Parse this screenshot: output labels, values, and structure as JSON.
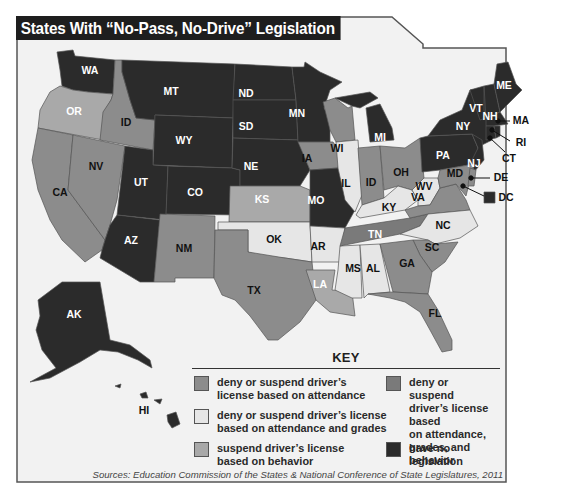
{
  "title": "States With “No-Pass, No-Drive” Legislation",
  "colors": {
    "attendance": "#8c8c8c",
    "attendance_grades": "#e6e6e6",
    "behavior": "#a9a9a9",
    "attendance_grades_behavior": "#7a7a7a",
    "none": "#2b2b2b",
    "background": "#f2f2f2",
    "border": "#555555"
  },
  "key": {
    "title": "KEY",
    "items": [
      {
        "id": "attendance",
        "label": "deny or suspend driver’s\nlicense based on attendance"
      },
      {
        "id": "attendance_grades",
        "label": "deny or suspend driver’s license\nbased on attendance and grades"
      },
      {
        "id": "behavior",
        "label": "suspend driver’s license\nbased on behavior"
      },
      {
        "id": "attendance_grades_behavior",
        "label": "deny or suspend\ndriver’s license based\non attendance,\ngrades, and behavior"
      },
      {
        "id": "none",
        "label": "have no legislation"
      }
    ]
  },
  "states": [
    {
      "label": "WA",
      "category": "none"
    },
    {
      "label": "OR",
      "category": "behavior"
    },
    {
      "label": "CA",
      "category": "attendance"
    },
    {
      "label": "NV",
      "category": "attendance"
    },
    {
      "label": "ID",
      "category": "attendance"
    },
    {
      "label": "MT",
      "category": "none"
    },
    {
      "label": "WY",
      "category": "none"
    },
    {
      "label": "UT",
      "category": "none"
    },
    {
      "label": "AZ",
      "category": "none"
    },
    {
      "label": "CO",
      "category": "none"
    },
    {
      "label": "NM",
      "category": "attendance"
    },
    {
      "label": "ND",
      "category": "none"
    },
    {
      "label": "SD",
      "category": "none"
    },
    {
      "label": "NE",
      "category": "none"
    },
    {
      "label": "KS",
      "category": "behavior"
    },
    {
      "label": "OK",
      "category": "attendance_grades"
    },
    {
      "label": "TX",
      "category": "attendance"
    },
    {
      "label": "MN",
      "category": "none"
    },
    {
      "label": "IA",
      "category": "attendance"
    },
    {
      "label": "MO",
      "category": "none"
    },
    {
      "label": "AR",
      "category": "attendance_grades"
    },
    {
      "label": "LA",
      "category": "behavior"
    },
    {
      "label": "WI",
      "category": "attendance"
    },
    {
      "label": "IL",
      "category": "attendance_grades"
    },
    {
      "label": "MI",
      "category": "none"
    },
    {
      "label": "ID",
      "category": "attendance",
      "note": "Indiana (labeled ID on map)"
    },
    {
      "label": "OH",
      "category": "attendance"
    },
    {
      "label": "KY",
      "category": "attendance_grades"
    },
    {
      "label": "TN",
      "category": "attendance_grades_behavior"
    },
    {
      "label": "MS",
      "category": "attendance_grades"
    },
    {
      "label": "AL",
      "category": "attendance_grades"
    },
    {
      "label": "GA",
      "category": "attendance"
    },
    {
      "label": "FL",
      "category": "attendance"
    },
    {
      "label": "SC",
      "category": "attendance"
    },
    {
      "label": "NC",
      "category": "attendance_grades"
    },
    {
      "label": "VA",
      "category": "attendance"
    },
    {
      "label": "WV",
      "category": "attendance_grades"
    },
    {
      "label": "PA",
      "category": "none"
    },
    {
      "label": "NY",
      "category": "none"
    },
    {
      "label": "VT",
      "category": "none"
    },
    {
      "label": "NH",
      "category": "none"
    },
    {
      "label": "ME",
      "category": "none"
    },
    {
      "label": "MA",
      "category": "none"
    },
    {
      "label": "RI",
      "category": "none"
    },
    {
      "label": "CT",
      "category": "none"
    },
    {
      "label": "NJ",
      "category": "none"
    },
    {
      "label": "DE",
      "category": "attendance"
    },
    {
      "label": "MD",
      "category": "attendance"
    },
    {
      "label": "DC",
      "category": "none"
    },
    {
      "label": "AK",
      "category": "none"
    },
    {
      "label": "HI",
      "category": "none"
    }
  ],
  "sources": "Sources: Education Commission of the States & National Conference of State Legislatures, 2011"
}
